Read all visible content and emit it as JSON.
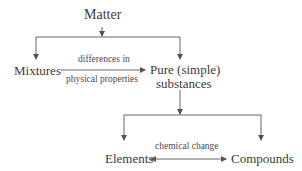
{
  "diagram": {
    "nodes": {
      "matter": "Matter",
      "mixtures": "Mixtures",
      "pure_line1": "Pure (simple)",
      "pure_line2": "substances",
      "elements": "Elements",
      "compounds": "Compounds"
    },
    "edges": {
      "mix_to_pure_top": "differences in",
      "mix_to_pure_bottom": "physical properties",
      "elements_compounds": "chemical change"
    },
    "colors": {
      "line": "#555555",
      "text": "#3a3a3a"
    }
  }
}
